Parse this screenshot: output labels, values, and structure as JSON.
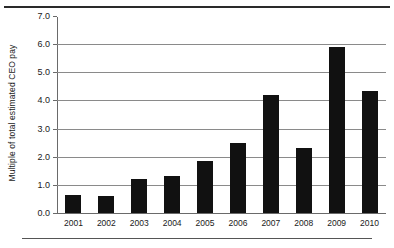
{
  "chart_data": {
    "type": "bar",
    "title": "",
    "xlabel": "",
    "ylabel": "Multiple of total estimated CEO pay",
    "categories": [
      "2001",
      "2002",
      "2003",
      "2004",
      "2005",
      "2006",
      "2007",
      "2008",
      "2009",
      "2010"
    ],
    "values": [
      0.65,
      0.6,
      1.2,
      1.3,
      1.85,
      2.5,
      4.2,
      2.3,
      5.9,
      4.35
    ],
    "ylim": [
      0.0,
      7.0
    ],
    "ytick_labels": [
      "0.0",
      "1.0",
      "2.0",
      "3.0",
      "4.0",
      "5.0",
      "6.0",
      "7.0"
    ],
    "ytick_values": [
      0.0,
      1.0,
      2.0,
      3.0,
      4.0,
      5.0,
      6.0,
      7.0
    ],
    "grid": true,
    "legend": false,
    "bar_color": "#111111",
    "grid_color": "#8a8a8a",
    "axis_color": "#6a6a6a",
    "background_color": "#ffffff"
  }
}
